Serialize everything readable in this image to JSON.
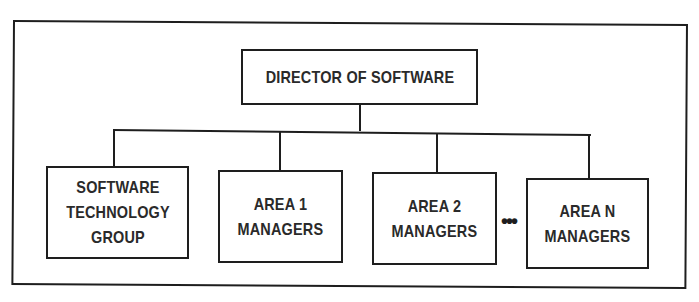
{
  "diagram": {
    "type": "org-chart",
    "root": {
      "label": "DIRECTOR OF SOFTWARE"
    },
    "children": [
      {
        "label": "SOFTWARE\nTECHNOLOGY\nGROUP"
      },
      {
        "label": "AREA 1\nMANAGERS"
      },
      {
        "label": "AREA 2\nMANAGERS"
      },
      {
        "label": "AREA N\nMANAGERS"
      }
    ],
    "ellipsis": "•••",
    "colors": {
      "stroke": "#1e1e1e",
      "text": "#2a2a2a",
      "background": "#ffffff"
    }
  }
}
